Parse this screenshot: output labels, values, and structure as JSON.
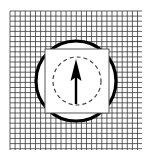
{
  "figure": {
    "canvas": {
      "width": 151,
      "height": 161,
      "background": "#ffffff"
    },
    "grid": {
      "name": "graph-paper-grid",
      "x": 10,
      "y": 11,
      "width": 132,
      "height": 139,
      "cell_size": 5.1,
      "columns": 26,
      "rows": 27,
      "line_color": "#3a3a3a",
      "line_width": 0.8,
      "fill": "#ffffff"
    },
    "circle": {
      "name": "outer-circle",
      "cx": 76,
      "cy": 81,
      "r": 40,
      "stroke": "#000000",
      "stroke_width": 3.2,
      "fill": "#ffffff"
    },
    "square": {
      "name": "inner-square",
      "x": 45,
      "y": 49,
      "width": 64,
      "height": 64,
      "stroke": "#555555",
      "stroke_width": 1,
      "fill": "#ffffff"
    },
    "dashed_circle": {
      "name": "dashed-circle",
      "cx": 77,
      "cy": 81,
      "r": 24,
      "stroke": "#444444",
      "stroke_width": 1.2,
      "dash": "4 3",
      "fill": "none"
    },
    "arrow": {
      "name": "up-arrow",
      "direction": "up",
      "tip_x": 76,
      "tip_y": 59,
      "tail_x": 76,
      "tail_y": 104,
      "head_width": 11,
      "head_height": 22,
      "shaft_width": 2.4,
      "color": "#000000"
    }
  }
}
